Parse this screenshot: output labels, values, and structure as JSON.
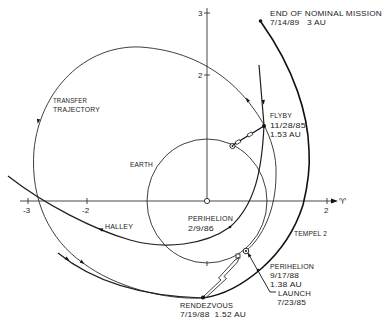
{
  "diagram": {
    "end_of_mission": {
      "line1": "END OF NOMINAL MISSION",
      "line2": "7/14/89   3 AU"
    },
    "axes": {
      "x_ticks": {
        "neg3": "-3",
        "neg2": "-2",
        "pos2": "2"
      },
      "y_ticks": {
        "pos3": "3",
        "pos2": "2"
      },
      "x_axis_symbol": "♈"
    },
    "labels": {
      "transfer": {
        "line1": "TRANSFER",
        "line2": "TRAJECTORY"
      },
      "earth": "EARTH",
      "flyby": {
        "line1": "FLYBY",
        "line2": "11/28/85",
        "line3": "1.53 AU"
      },
      "halley": "HALLEY",
      "halley_perihelion": {
        "line1": "PERIHELION",
        "line2": "2/9/86"
      },
      "tempel": "TEMPEL 2",
      "tempel_perihelion": {
        "line1": "PERIHELION",
        "line2": "9/17/88",
        "line3": "1.38 AU"
      },
      "launch": {
        "line1": "LAUNCH",
        "line2": "7/23/85"
      },
      "rendezvous": {
        "line1": "RENDEZVOUS",
        "line2": "7/19/88  1.52 AU"
      }
    },
    "colors": {
      "ink": "#1a1a1a",
      "text": "#222222",
      "background": "#ffffff"
    }
  }
}
